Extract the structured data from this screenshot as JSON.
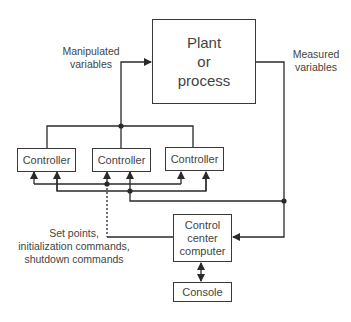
{
  "diagram": {
    "type": "control-system-block-diagram",
    "nodes": {
      "plant": {
        "label_lines": [
          "Plant",
          "or",
          "process"
        ]
      },
      "controller_1": {
        "label": "Controller"
      },
      "controller_2": {
        "label": "Controller"
      },
      "controller_3": {
        "label": "Controller"
      },
      "control_center": {
        "label_lines": [
          "Control",
          "center",
          "computer"
        ]
      },
      "console": {
        "label": "Console"
      }
    },
    "labels": {
      "manipulated": [
        "Manipulated",
        "variables"
      ],
      "measured": [
        "Measured",
        "variables"
      ],
      "setpoints": [
        "Set points,",
        "initialization commands,",
        "shutdown commands"
      ]
    },
    "edges": [
      {
        "from": "controllers",
        "to": "plant",
        "label": "Manipulated variables"
      },
      {
        "from": "plant",
        "to": "control_center",
        "label": "Measured variables"
      },
      {
        "from": "plant",
        "to": "controllers",
        "label": "Measured variables"
      },
      {
        "from": "control_center",
        "to": "controllers",
        "label": "Set points, initialization commands, shutdown commands",
        "style": "dotted"
      },
      {
        "from": "control_center",
        "to": "console",
        "bidirectional": true
      }
    ],
    "colors": {
      "line": "#2a2a2a",
      "text": "#444444"
    }
  }
}
